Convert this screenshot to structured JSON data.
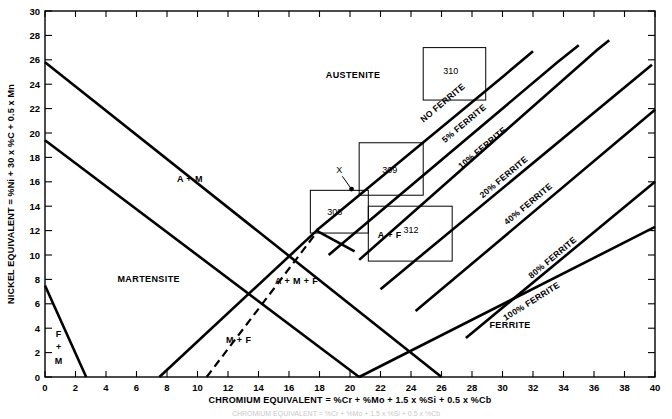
{
  "chart_data": {
    "type": "line",
    "title": "",
    "xlabel": "CHROMIUM EQUIVALENT = %Cr + %Mo + 1.5 x %Si + 0.5 x %Cb",
    "ylabel": "NICKEL EQUIVALENT = %Ni + 30 x %C + 0.5 x Mn",
    "xlim": [
      0,
      40
    ],
    "ylim": [
      0,
      30
    ],
    "xticks": [
      0,
      2,
      4,
      6,
      8,
      10,
      12,
      14,
      16,
      18,
      20,
      22,
      24,
      26,
      28,
      30,
      32,
      34,
      36,
      38,
      40
    ],
    "yticks": [
      0,
      2,
      4,
      6,
      8,
      10,
      12,
      14,
      16,
      18,
      20,
      22,
      24,
      26,
      28,
      30
    ],
    "xtick_labels": [
      "0",
      "2",
      "4",
      "6",
      "8",
      "10",
      "12",
      "14",
      "16",
      "18",
      "20",
      "22",
      "24",
      "26",
      "28",
      "30",
      "32",
      "34",
      "36",
      "38",
      "40"
    ],
    "ytick_labels": [
      "0",
      "2",
      "4",
      "6",
      "8",
      "10",
      "12",
      "14",
      "16",
      "18",
      "20",
      "22",
      "24",
      "26",
      "28",
      "30"
    ],
    "grid": false,
    "legend": "none",
    "series": [
      {
        "name": "NO FERRITE (0% ferrite boundary)",
        "points": [
          [
            17.8,
            12.0
          ],
          [
            30.0,
            24.6
          ],
          [
            32.0,
            26.7
          ]
        ]
      },
      {
        "name": "5% FERRITE",
        "points": [
          [
            18.6,
            10.0
          ],
          [
            33.6,
            25.8
          ],
          [
            35.0,
            27.2
          ]
        ]
      },
      {
        "name": "10% FERRITE",
        "points": [
          [
            20.6,
            9.6
          ],
          [
            36.2,
            26.8
          ],
          [
            37.0,
            27.6
          ]
        ]
      },
      {
        "name": "20% FERRITE",
        "points": [
          [
            22.0,
            7.2
          ],
          [
            39.8,
            25.6
          ]
        ]
      },
      {
        "name": "40% FERRITE",
        "points": [
          [
            24.3,
            5.4
          ],
          [
            40.0,
            21.9
          ]
        ]
      },
      {
        "name": "80% FERRITE",
        "points": [
          [
            27.6,
            3.2
          ],
          [
            40.0,
            16.0
          ]
        ]
      },
      {
        "name": "100% FERRITE",
        "points": [
          [
            20.6,
            0.0
          ],
          [
            40.0,
            12.3
          ]
        ]
      },
      {
        "name": "austenite / A+M upper boundary",
        "points": [
          [
            0.0,
            25.8
          ],
          [
            26.0,
            0.0
          ]
        ]
      },
      {
        "name": "A+M lower boundary",
        "points": [
          [
            0.0,
            19.4
          ],
          [
            20.6,
            0.0
          ]
        ]
      },
      {
        "name": "martensite / M+F boundary",
        "points": [
          [
            7.5,
            0.0
          ],
          [
            17.9,
            12.1
          ]
        ]
      },
      {
        "name": "F+M left boundary",
        "points": [
          [
            0.0,
            7.5
          ],
          [
            2.7,
            0.0
          ]
        ]
      },
      {
        "name": "A+M+F short tie line",
        "points": [
          [
            17.8,
            12.0
          ],
          [
            20.3,
            10.3
          ]
        ]
      },
      {
        "name": "dashed M+F / A+M+F boundary",
        "points": [
          [
            10.6,
            0.0
          ],
          [
            17.9,
            12.0
          ]
        ],
        "style": "dashed"
      }
    ],
    "region_labels": [
      {
        "text": "AUSTENITE",
        "x": 20.2,
        "y": 24.5
      },
      {
        "text": "A + M",
        "x": 9.5,
        "y": 16.0
      },
      {
        "text": "MARTENSITE",
        "x": 6.8,
        "y": 7.8
      },
      {
        "text": "F",
        "x": 0.9,
        "y": 3.3
      },
      {
        "text": "+",
        "x": 0.9,
        "y": 2.2
      },
      {
        "text": "M",
        "x": 0.9,
        "y": 1.1
      },
      {
        "text": "A + M + F",
        "x": 16.5,
        "y": 7.6
      },
      {
        "text": "M + F",
        "x": 12.7,
        "y": 2.8
      },
      {
        "text": "A + F",
        "x": 22.6,
        "y": 11.4
      },
      {
        "text": "FERRITE",
        "x": 30.5,
        "y": 4.0
      }
    ],
    "ferrite_line_labels": [
      {
        "text": "NO FERRITE",
        "x": 26.2,
        "y": 22.3,
        "angle": -40
      },
      {
        "text": "5% FERRITE",
        "x": 27.6,
        "y": 20.6,
        "angle": -40
      },
      {
        "text": "10% FERRITE",
        "x": 28.8,
        "y": 18.6,
        "angle": -40
      },
      {
        "text": "20% FERRITE",
        "x": 30.2,
        "y": 16.2,
        "angle": -40
      },
      {
        "text": "40% FERRITE",
        "x": 31.8,
        "y": 14.0,
        "angle": -40
      },
      {
        "text": "80% FERRITE",
        "x": 33.4,
        "y": 9.6,
        "angle": -40
      },
      {
        "text": "100% FERRITE",
        "x": 32.0,
        "y": 6.0,
        "angle": -32
      }
    ],
    "grade_boxes": [
      {
        "label": "310",
        "x0": 24.8,
        "y0": 22.7,
        "x1": 28.9,
        "y1": 27.0,
        "label_x": 26.6,
        "label_y": 24.8
      },
      {
        "label": "309",
        "x0": 20.6,
        "y0": 14.9,
        "x1": 24.8,
        "y1": 19.2,
        "label_x": 22.6,
        "label_y": 16.7
      },
      {
        "label": "308",
        "x0": 17.4,
        "y0": 11.8,
        "x1": 21.2,
        "y1": 15.3,
        "label_x": 19.0,
        "label_y": 13.3
      },
      {
        "label": "312",
        "x0": 21.2,
        "y0": 9.5,
        "x1": 26.7,
        "y1": 14.0,
        "label_x": 24.0,
        "label_y": 11.8
      }
    ],
    "point_markers": [
      {
        "label": "X",
        "label_x": 19.3,
        "label_y": 16.7,
        "point_x": 20.1,
        "point_y": 15.4
      }
    ],
    "caption": "CHROMIUM EQUIVALENT = %Cr + %Mo + 1.5 x %Si + 0.5 x %Cb"
  },
  "axes": {
    "x_title": "CHROMIUM EQUIVALENT = %Cr + %Mo + 1.5 x %Si + 0.5 x %Cb",
    "y_title": "NICKEL EQUIVALENT = %Ni + 30 x %C + 0.5 x Mn"
  }
}
